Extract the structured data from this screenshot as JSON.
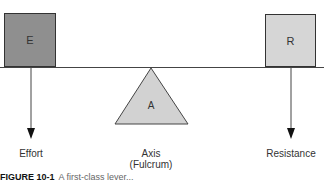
{
  "diagram": {
    "type": "first-class lever",
    "boxes": {
      "effort": {
        "letter": "E",
        "color": "#8f8f8f"
      },
      "resistance": {
        "letter": "R",
        "color": "#d6d6d6"
      }
    },
    "fulcrum": {
      "letter": "A",
      "color": "#d2d2d2"
    },
    "labels": {
      "effort": "Effort",
      "axis": "Axis",
      "axis_sub": "(Fulcrum)",
      "resistance": "Resistance"
    },
    "caption": {
      "figure": "FIGURE 10-1",
      "text": "A first-class lever..."
    },
    "colors": {
      "line": "#444444",
      "arrow": "#111111"
    }
  }
}
